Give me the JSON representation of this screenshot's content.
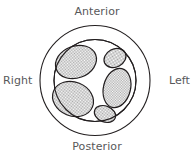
{
  "figure": {
    "type": "anatomical-cross-section",
    "labels": {
      "anterior": "Anterior",
      "posterior": "Posterior",
      "right": "Right",
      "left": "Left"
    },
    "colors": {
      "background": "#ffffff",
      "outline": "#231f20",
      "fascicle_fill": "#c9c9c9",
      "label_text": "#58585a",
      "epineurium_fill": "#ffffff"
    },
    "geometry": {
      "outer_circle": {
        "cx": 95,
        "cy": 80.5,
        "r": 55
      },
      "inner_circle": {
        "cx": 95,
        "cy": 80.5,
        "r": 41
      }
    },
    "fascicles": [
      {
        "name": "anterior-right-fascicle",
        "cx": 76,
        "cy": 62,
        "rx": 21,
        "ry": 16,
        "rotation": -20
      },
      {
        "name": "anterior-left-fascicle",
        "cx": 115,
        "cy": 58,
        "rx": 11,
        "ry": 9,
        "rotation": -25
      },
      {
        "name": "posterior-right-fascicle",
        "cx": 73,
        "cy": 99,
        "rx": 21,
        "ry": 17,
        "rotation": 20
      },
      {
        "name": "lateral-left-fascicle",
        "cx": 117,
        "cy": 88,
        "rx": 14,
        "ry": 20,
        "rotation": 15
      },
      {
        "name": "posterior-left-fascicle",
        "cx": 105,
        "cy": 114,
        "rx": 11,
        "ry": 8,
        "rotation": 20
      }
    ]
  }
}
